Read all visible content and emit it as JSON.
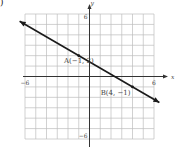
{
  "panel_label": ")",
  "chart_data": {
    "type": "line",
    "title": "",
    "xlabel": "x",
    "ylabel": "y",
    "xlim": [
      -6,
      6
    ],
    "ylim": [
      -6,
      6
    ],
    "grid": true,
    "x_ticks_labeled": [
      {
        "value": -6,
        "label": "−6"
      },
      {
        "value": 6,
        "label": "6"
      }
    ],
    "y_ticks_labeled": [
      {
        "value": 6,
        "label": "6"
      },
      {
        "value": -6,
        "label": "−6"
      }
    ],
    "series": [
      {
        "name": "line AB",
        "equation": "y = -0.6x + 1.4",
        "arrows_both_ends": true,
        "x": [
          -6.5,
          6.5
        ],
        "y": [
          5.3,
          -2.5
        ]
      }
    ],
    "points": [
      {
        "name": "A",
        "x": -1,
        "y": 2,
        "label": "A(−1, 2)"
      },
      {
        "name": "B",
        "x": 4,
        "y": -1,
        "label": "B(4, −1)"
      }
    ],
    "colors": {
      "line": "#1a1a1a",
      "grid": "#bdbdbd",
      "axis": "#333333"
    }
  }
}
